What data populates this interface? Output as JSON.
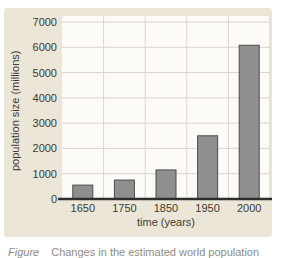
{
  "figure": {
    "colors": {
      "panel_bg": "#ebe6d8",
      "plot_bg": "#fcfbf7",
      "grid": "#d9d5c9",
      "bar_fill": "#8f8f8f",
      "bar_stroke": "#4c4c4c",
      "axis_line": "#2e2e2e",
      "text": "#403a31",
      "caption_text": "#8f8b81"
    }
  },
  "chart_data": {
    "type": "bar",
    "title": "",
    "categories": [
      "1650",
      "1750",
      "1850",
      "1950",
      "2000"
    ],
    "values": [
      550,
      750,
      1150,
      2500,
      6080
    ],
    "xlabel": "time (years)",
    "ylabel": "population size (millions)",
    "ylim": [
      0,
      7000
    ],
    "yticks": [
      0,
      1000,
      2000,
      3000,
      4000,
      5000,
      6000,
      7000
    ],
    "grid": "on",
    "legend": "none"
  },
  "caption": {
    "label": "Figure",
    "text": "Changes in the estimated world population"
  }
}
